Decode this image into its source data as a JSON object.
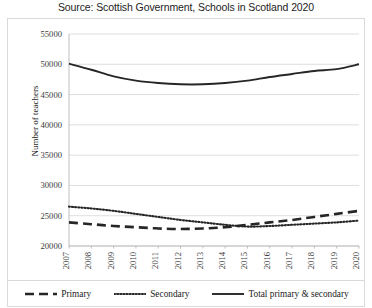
{
  "chart_data": {
    "type": "line",
    "title": "Source: Scottish Government, Schools in Scotland 2020",
    "xlabel": "",
    "ylabel": "Number of teachers",
    "x": [
      2007,
      2008,
      2009,
      2010,
      2011,
      2012,
      2013,
      2014,
      2015,
      2016,
      2017,
      2018,
      2019,
      2020
    ],
    "categories": [
      "2007",
      "2008",
      "2009",
      "2010",
      "2011",
      "2012",
      "2013",
      "2014",
      "2015",
      "2016",
      "2017",
      "2018",
      "2019",
      "2020"
    ],
    "ylim": [
      20000,
      55000
    ],
    "yticks": [
      20000,
      25000,
      30000,
      35000,
      40000,
      45000,
      50000,
      55000
    ],
    "ytick_labels": [
      "20000",
      "25000",
      "30000",
      "35000",
      "40000",
      "45000",
      "50000",
      "55000"
    ],
    "grid": true,
    "legend_position": "bottom",
    "series": [
      {
        "name": "Primary",
        "style": "dashed",
        "color": "#262626",
        "values": [
          23900,
          23600,
          23300,
          23100,
          22900,
          22800,
          22900,
          23100,
          23500,
          23900,
          24300,
          24800,
          25300,
          25800
        ]
      },
      {
        "name": "Secondary",
        "style": "dotted",
        "color": "#262626",
        "values": [
          26500,
          26200,
          25800,
          25300,
          24800,
          24300,
          23900,
          23500,
          23200,
          23300,
          23500,
          23700,
          23900,
          24200
        ]
      },
      {
        "name": "Total primary & secondary",
        "style": "solid",
        "color": "#262626",
        "values": [
          50100,
          49100,
          48000,
          47300,
          46900,
          46700,
          46700,
          46900,
          47300,
          47900,
          48400,
          48900,
          49200,
          50000
        ]
      }
    ]
  },
  "legend": {
    "items": [
      {
        "label": "Primary",
        "marker": "dashed-line-icon"
      },
      {
        "label": "Secondary",
        "marker": "dotted-line-icon"
      },
      {
        "label": "Total primary & secondary",
        "marker": "solid-line-icon"
      }
    ]
  }
}
